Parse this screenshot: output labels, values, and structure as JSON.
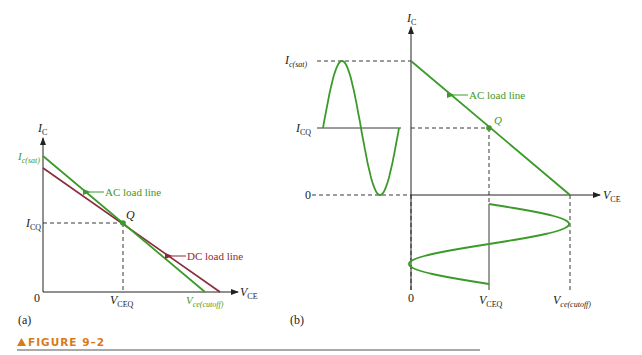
{
  "figure": {
    "caption": "FIGURE 9–2",
    "accent_color": "#d97a1a"
  },
  "panel_a": {
    "label": "(a)",
    "y_axis": {
      "var": "I",
      "sub": "C"
    },
    "x_axis": {
      "var": "V",
      "sub": "CE"
    },
    "origin": "0",
    "ic_sat": {
      "var": "I",
      "sub": "c(sat)"
    },
    "icq": {
      "var": "I",
      "sub": "CQ"
    },
    "vceq": {
      "var": "V",
      "sub": "CEQ"
    },
    "vce_cutoff": {
      "var": "V",
      "sub": "ce(cutoff)"
    },
    "q_point": "Q",
    "ac_load_line": "AC load line",
    "dc_load_line": "DC load line",
    "colors": {
      "ac": "#3c9a2a",
      "dc": "#8a2a3c"
    }
  },
  "panel_b": {
    "label": "(b)",
    "y_axis": {
      "var": "I",
      "sub": "C"
    },
    "x_axis": {
      "var": "V",
      "sub": "CE"
    },
    "origin_x": "0",
    "origin_y": "0",
    "ic_sat": {
      "var": "I",
      "sub": "c(sat)"
    },
    "icq": {
      "var": "I",
      "sub": "CQ"
    },
    "vceq": {
      "var": "V",
      "sub": "CEQ"
    },
    "vce_cutoff": {
      "var": "V",
      "sub": "ce(cutoff)"
    },
    "q_point": "Q",
    "ac_load_line": "AC load line",
    "colors": {
      "ac": "#3c9a2a"
    }
  }
}
